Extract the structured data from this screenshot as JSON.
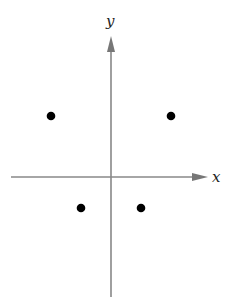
{
  "diagram": {
    "type": "coordinate-plane-points",
    "axes": {
      "x_label": "x",
      "y_label": "y",
      "color": "#808080"
    },
    "points": [
      {
        "quadrant": "II",
        "px": 51,
        "py": 116
      },
      {
        "quadrant": "I",
        "px": 171,
        "py": 116
      },
      {
        "quadrant": "III",
        "px": 81,
        "py": 208
      },
      {
        "quadrant": "IV",
        "px": 141,
        "py": 208
      }
    ],
    "point_color": "#000000"
  }
}
